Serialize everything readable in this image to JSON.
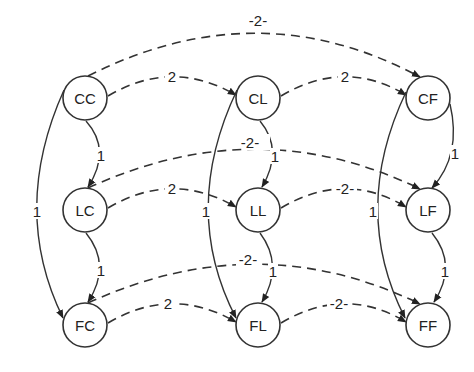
{
  "diagram": {
    "type": "directed-graph",
    "nodes": [
      {
        "id": "CC",
        "label": "CC",
        "x": 85,
        "y": 98
      },
      {
        "id": "CL",
        "label": "CL",
        "x": 258,
        "y": 98
      },
      {
        "id": "CF",
        "label": "CF",
        "x": 428,
        "y": 98
      },
      {
        "id": "LC",
        "label": "LC",
        "x": 85,
        "y": 210
      },
      {
        "id": "LL",
        "label": "LL",
        "x": 258,
        "y": 210
      },
      {
        "id": "LF",
        "label": "LF",
        "x": 428,
        "y": 210
      },
      {
        "id": "FC",
        "label": "FC",
        "x": 85,
        "y": 325
      },
      {
        "id": "FL",
        "label": "FL",
        "x": 258,
        "y": 325
      },
      {
        "id": "FF",
        "label": "FF",
        "x": 428,
        "y": 325
      }
    ],
    "edges": [
      {
        "from": "CC",
        "to": "CL",
        "label": "2",
        "style": "dashed"
      },
      {
        "from": "CL",
        "to": "CF",
        "label": "2",
        "style": "dashed"
      },
      {
        "from": "CC",
        "to": "CF",
        "label": "2",
        "style": "dashed"
      },
      {
        "from": "LC",
        "to": "LL",
        "label": "2",
        "style": "dashed"
      },
      {
        "from": "LL",
        "to": "LF",
        "label": "2",
        "style": "dashed"
      },
      {
        "from": "LC",
        "to": "LF",
        "label": "2",
        "style": "dashed"
      },
      {
        "from": "FC",
        "to": "FL",
        "label": "2",
        "style": "dashed"
      },
      {
        "from": "FL",
        "to": "FF",
        "label": "2",
        "style": "dashed"
      },
      {
        "from": "FC",
        "to": "FF",
        "label": "2",
        "style": "dashed"
      },
      {
        "from": "CC",
        "to": "LC",
        "label": "1",
        "style": "solid"
      },
      {
        "from": "LC",
        "to": "FC",
        "label": "1",
        "style": "solid"
      },
      {
        "from": "CC",
        "to": "FC",
        "label": "1",
        "style": "solid"
      },
      {
        "from": "CL",
        "to": "LL",
        "label": "1",
        "style": "solid"
      },
      {
        "from": "LL",
        "to": "FL",
        "label": "1",
        "style": "solid"
      },
      {
        "from": "CL",
        "to": "FL",
        "label": "1",
        "style": "solid"
      },
      {
        "from": "CF",
        "to": "LF",
        "label": "1",
        "style": "solid"
      },
      {
        "from": "LF",
        "to": "FF",
        "label": "1",
        "style": "solid"
      },
      {
        "from": "CF",
        "to": "FF",
        "label": "1",
        "style": "solid"
      }
    ]
  },
  "labels": {
    "nodes": {
      "CC": "CC",
      "CL": "CL",
      "CF": "CF",
      "LC": "LC",
      "LL": "LL",
      "LF": "LF",
      "FC": "FC",
      "FL": "FL",
      "FF": "FF"
    },
    "edges": {
      "cc_cl": "2",
      "cl_cf": "2",
      "cc_cf": "-2-",
      "lc_ll": "2",
      "ll_lf": "-2-",
      "lc_lf": "-2-",
      "fc_fl": "2",
      "fl_ff": "-2-",
      "fc_ff": "-2-",
      "cc_lc": "1",
      "lc_fc": "1",
      "cc_fc": "1",
      "cl_ll": "1",
      "ll_fl": "1",
      "cl_fl": "1",
      "cf_lf": "1",
      "lf_ff": "1",
      "cf_ff": "1"
    }
  }
}
